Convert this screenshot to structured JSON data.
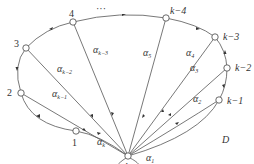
{
  "diagram": {
    "region_label": "D",
    "center_node": {
      "id": "k",
      "label": "k",
      "x": 128,
      "y": 156
    },
    "ellipsis": "···",
    "boundary_nodes": [
      {
        "id": "1",
        "label": "1",
        "x": 76,
        "y": 131,
        "lx": 72,
        "ly": 146
      },
      {
        "id": "2",
        "label": "2",
        "x": 21,
        "y": 93,
        "lx": 7,
        "ly": 96
      },
      {
        "id": "3",
        "label": "3",
        "x": 26,
        "y": 48,
        "lx": 14,
        "ly": 47
      },
      {
        "id": "4",
        "label": "4",
        "x": 73,
        "y": 22,
        "lx": 69,
        "ly": 17
      },
      {
        "id": "k-4",
        "label": "k−4",
        "x": 166,
        "y": 18,
        "lx": 170,
        "ly": 14
      },
      {
        "id": "k-3",
        "label": "k−3",
        "x": 215,
        "y": 37,
        "lx": 223,
        "ly": 40
      },
      {
        "id": "k-2",
        "label": "k−2",
        "x": 227,
        "y": 68,
        "lx": 235,
        "ly": 71
      },
      {
        "id": "k-1",
        "label": "k−1",
        "x": 219,
        "y": 100,
        "lx": 227,
        "ly": 104
      }
    ],
    "edge_labels": [
      {
        "text": "α",
        "sub": "k",
        "x": 97,
        "y": 145
      },
      {
        "text": "α",
        "sub": "k−1",
        "x": 52,
        "y": 97
      },
      {
        "text": "α",
        "sub": "k−2",
        "x": 57,
        "y": 72
      },
      {
        "text": "α",
        "sub": "k−3",
        "x": 93,
        "y": 53
      },
      {
        "text": "α",
        "sub": "5",
        "x": 143,
        "y": 56
      },
      {
        "text": "α",
        "sub": "4",
        "x": 186,
        "y": 56
      },
      {
        "text": "α",
        "sub": "3",
        "x": 190,
        "y": 71
      },
      {
        "text": "α",
        "sub": "2",
        "x": 193,
        "y": 102
      },
      {
        "text": "α",
        "sub": "1",
        "x": 146,
        "y": 161
      }
    ]
  }
}
